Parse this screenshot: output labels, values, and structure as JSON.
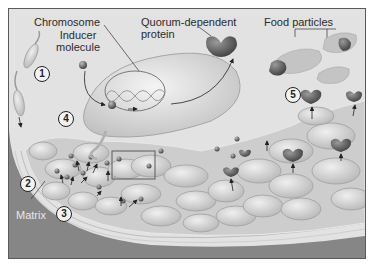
{
  "diagram": {
    "labels": {
      "chromosome": "Chromosome",
      "inducer_line1": "Inducer",
      "inducer_line2": "molecule",
      "quorum_line1": "Quorum-dependent",
      "quorum_line2": "protein",
      "food_particles": "Food particles",
      "matrix": "Matrix"
    },
    "steps": [
      "1",
      "2",
      "3",
      "4",
      "5"
    ],
    "colors": {
      "background": "#e4e4e4",
      "cell_fill": "#d6d6d6",
      "cell_stroke": "#9a9a9a",
      "protein_fill": "#6e6e6e",
      "surface_dark": "#7a7a7a",
      "matrix_fill": "#c9c9c9",
      "frame_border": "#5a5a5a"
    }
  }
}
